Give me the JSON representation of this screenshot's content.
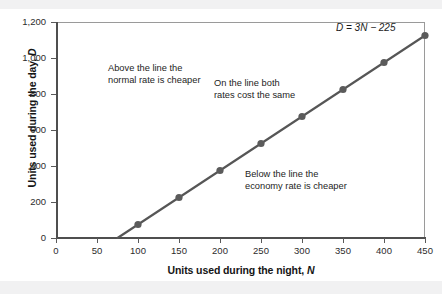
{
  "chart_data": {
    "type": "line",
    "title": "",
    "xlabel": "Units used during the night, N",
    "xlabel_main": "Units used during the night,",
    "xlabel_italic": "N",
    "ylabel": "Units used during the day, D",
    "ylabel_main": "Units used during the day,",
    "ylabel_italic": "D",
    "xlim": [
      0,
      450
    ],
    "ylim": [
      0,
      1200
    ],
    "xticks": [
      0,
      50,
      100,
      150,
      200,
      250,
      300,
      350,
      400,
      450
    ],
    "xtick_labels": [
      "0",
      "50",
      "100",
      "150",
      "200",
      "250",
      "300",
      "350",
      "400",
      "450"
    ],
    "yticks": [
      0,
      200,
      400,
      600,
      800,
      1000,
      1200
    ],
    "ytick_labels": [
      "0",
      "200",
      "400",
      "600",
      "800",
      "1,000",
      "1,200"
    ],
    "grid": false,
    "legend": "none",
    "equation": "D = 3N − 225",
    "x_intercept": 75,
    "slope": 3,
    "intercept": -225,
    "series": [
      {
        "name": "D = 3N - 225",
        "color": "#565656",
        "marker": "circle",
        "x": [
          75,
          100,
          150,
          200,
          250,
          300,
          350,
          400,
          450
        ],
        "y": [
          0,
          75,
          225,
          375,
          525,
          675,
          825,
          975,
          1125
        ],
        "marker_x": [
          100,
          150,
          200,
          250,
          300,
          350,
          400,
          450
        ],
        "marker_y": [
          75,
          225,
          375,
          525,
          675,
          825,
          975,
          1125
        ]
      }
    ],
    "annotations": [
      {
        "name": "above-the-line",
        "text": "Above the line the\nnormal rate is cheaper",
        "x": 110,
        "y": 940
      },
      {
        "name": "on-the-line",
        "text": "On the line both\nrates cost the same",
        "x": 235,
        "y": 855
      },
      {
        "name": "below-the-line",
        "text": "Below the line the\neconomy rate is cheaper",
        "x": 280,
        "y": 350
      }
    ],
    "colors": {
      "line": "#565656",
      "marker": "#5b5b5b",
      "axis": "#4f4f4f",
      "frame": "#9a9a9a",
      "text": "#242424",
      "background": "#ffffff"
    }
  }
}
